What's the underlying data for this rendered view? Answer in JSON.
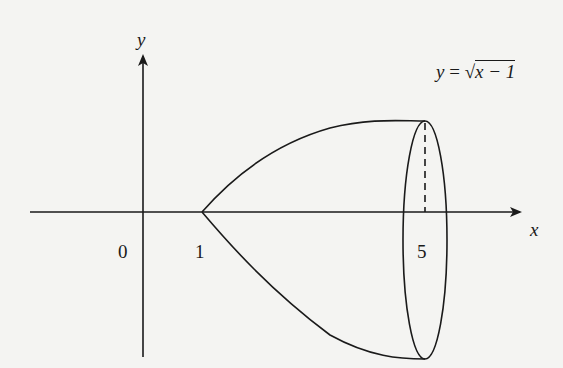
{
  "figure": {
    "type": "solid-of-revolution",
    "axes": {
      "x_label": "x",
      "y_label": "y"
    },
    "ticks": {
      "origin": "0",
      "x1": "1",
      "x5": "5"
    },
    "curve_label": {
      "lhs": "y",
      "eq": "=",
      "sqrt_symbol": "√",
      "radicand": "x − 1"
    },
    "colors": {
      "ink": "#1a1a1a",
      "background": "#f4f4f2"
    }
  }
}
